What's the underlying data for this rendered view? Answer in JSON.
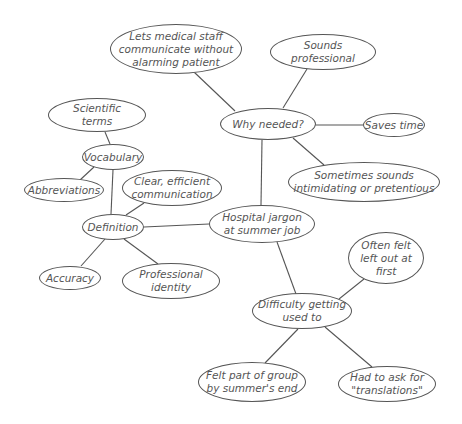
{
  "diagram": {
    "type": "mind-map",
    "line_color": "#555555",
    "center_node": "hospital_jargon",
    "nodes": [
      {
        "id": "lets_medical",
        "label": "Lets medical staff\ncommunicate without\nalarming patient",
        "cx": 176,
        "cy": 49,
        "rx": 66,
        "ry": 25
      },
      {
        "id": "sounds_professional",
        "label": "Sounds\nprofessional",
        "cx": 323,
        "cy": 52,
        "rx": 53,
        "ry": 18
      },
      {
        "id": "why_needed",
        "label": "Why needed?",
        "cx": 268,
        "cy": 124,
        "rx": 48,
        "ry": 16
      },
      {
        "id": "saves_time",
        "label": "Saves time",
        "cx": 394,
        "cy": 125,
        "rx": 31,
        "ry": 12
      },
      {
        "id": "intimidating",
        "label": "Sometimes sounds\nintimidating or pretentious",
        "cx": 364,
        "cy": 182,
        "rx": 76,
        "ry": 20
      },
      {
        "id": "scientific_terms",
        "label": "Scientific\nterms",
        "cx": 97,
        "cy": 115,
        "rx": 49,
        "ry": 17
      },
      {
        "id": "vocabulary",
        "label": "Vocabulary",
        "cx": 113,
        "cy": 157,
        "rx": 31,
        "ry": 13
      },
      {
        "id": "abbreviations",
        "label": "Abbreviations",
        "cx": 64,
        "cy": 190,
        "rx": 40,
        "ry": 12
      },
      {
        "id": "clear_efficient",
        "label": "Clear, efficient\ncommunication",
        "cx": 172,
        "cy": 188,
        "rx": 50,
        "ry": 18
      },
      {
        "id": "definition",
        "label": "Definition",
        "cx": 113,
        "cy": 227,
        "rx": 31,
        "ry": 13
      },
      {
        "id": "hospital_jargon",
        "label": "Hospital jargon\nat summer job",
        "cx": 262,
        "cy": 224,
        "rx": 53,
        "ry": 19
      },
      {
        "id": "accuracy",
        "label": "Accuracy",
        "cx": 70,
        "cy": 278,
        "rx": 31,
        "ry": 12
      },
      {
        "id": "professional_identity",
        "label": "Professional\nidentity",
        "cx": 171,
        "cy": 281,
        "rx": 49,
        "ry": 18
      },
      {
        "id": "left_out",
        "label": "Often felt\nleft out at\nfirst",
        "cx": 386,
        "cy": 258,
        "rx": 38,
        "ry": 26
      },
      {
        "id": "difficulty",
        "label": "Difficulty getting\nused to",
        "cx": 302,
        "cy": 311,
        "rx": 50,
        "ry": 18
      },
      {
        "id": "felt_part",
        "label": "Felt part of group\nby summer's end",
        "cx": 252,
        "cy": 382,
        "rx": 54,
        "ry": 20
      },
      {
        "id": "translations",
        "label": "Had to ask for\n\"translations\"",
        "cx": 387,
        "cy": 384,
        "rx": 49,
        "ry": 18
      }
    ],
    "edges": [
      {
        "from": "why_needed",
        "to": "lets_medical",
        "x1": 235,
        "y1": 111,
        "x2": 194,
        "y2": 72
      },
      {
        "from": "why_needed",
        "to": "sounds_professional",
        "x1": 283,
        "y1": 108,
        "x2": 307,
        "y2": 69
      },
      {
        "from": "why_needed",
        "to": "saves_time",
        "x1": 316,
        "y1": 125,
        "x2": 363,
        "y2": 125
      },
      {
        "from": "why_needed",
        "to": "intimidating",
        "x1": 293,
        "y1": 138,
        "x2": 324,
        "y2": 165
      },
      {
        "from": "why_needed",
        "to": "hospital_jargon",
        "x1": 262,
        "y1": 140,
        "x2": 261,
        "y2": 205
      },
      {
        "from": "vocabulary",
        "to": "scientific_terms",
        "x1": 110,
        "y1": 144,
        "x2": 105,
        "y2": 132
      },
      {
        "from": "vocabulary",
        "to": "abbreviations",
        "x1": 94,
        "y1": 167,
        "x2": 80,
        "y2": 180
      },
      {
        "from": "vocabulary",
        "to": "definition",
        "x1": 113,
        "y1": 170,
        "x2": 111,
        "y2": 214
      },
      {
        "from": "definition",
        "to": "clear_efficient",
        "x1": 126,
        "y1": 215,
        "x2": 144,
        "y2": 203
      },
      {
        "from": "definition",
        "to": "hospital_jargon",
        "x1": 144,
        "y1": 227,
        "x2": 209,
        "y2": 224
      },
      {
        "from": "definition",
        "to": "accuracy",
        "x1": 105,
        "y1": 239,
        "x2": 81,
        "y2": 266
      },
      {
        "from": "definition",
        "to": "professional_identity",
        "x1": 124,
        "y1": 239,
        "x2": 158,
        "y2": 264
      },
      {
        "from": "hospital_jargon",
        "to": "difficulty",
        "x1": 277,
        "y1": 242,
        "x2": 296,
        "y2": 294
      },
      {
        "from": "difficulty",
        "to": "left_out",
        "x1": 339,
        "y1": 299,
        "x2": 364,
        "y2": 279
      },
      {
        "from": "difficulty",
        "to": "felt_part",
        "x1": 298,
        "y1": 329,
        "x2": 265,
        "y2": 363
      },
      {
        "from": "difficulty",
        "to": "translations",
        "x1": 325,
        "y1": 327,
        "x2": 372,
        "y2": 367
      }
    ]
  }
}
